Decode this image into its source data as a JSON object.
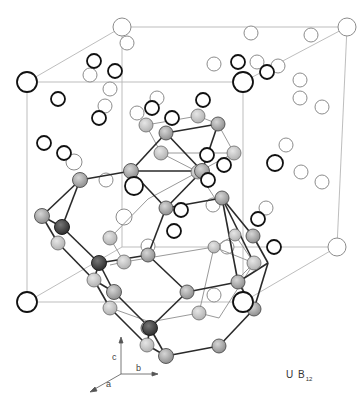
{
  "figure": {
    "formula": {
      "element1": "U",
      "element2": "B",
      "subscript": "12"
    },
    "axes": {
      "a": "a",
      "b": "b",
      "c": "c"
    },
    "colors": {
      "cell_edge": "#b0b0b0",
      "bond_dark": "#222222",
      "bond_light": "#999999",
      "u_atom_stroke": "#111111",
      "u_atom_back_stroke": "#888888",
      "b_atom_fill": "#a9a9a9",
      "b_atom_light_fill": "#c8c8c8",
      "b_atom_dark_fill": "#555555"
    },
    "legend": {
      "open_circles": "U atoms",
      "shaded_spheres": "B atoms (B12 cuboctahedron)"
    }
  }
}
